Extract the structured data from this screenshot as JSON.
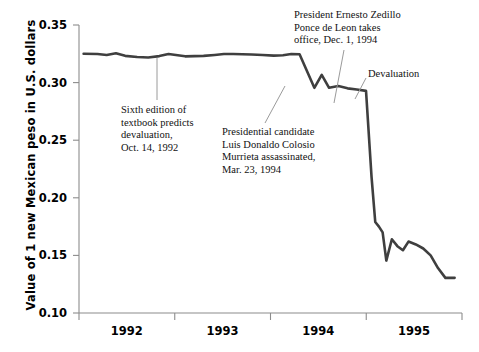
{
  "chart_data": {
    "type": "line",
    "title": "",
    "xlabel": "",
    "ylabel": "Value of 1 new Mexican peso in U.S. dollars",
    "ylim": [
      0.1,
      0.35
    ],
    "ytick_labels": [
      "0.35",
      "0.30",
      "0.25",
      "0.20",
      "0.15",
      "0.10"
    ],
    "ytick_values": [
      0.35,
      0.3,
      0.25,
      0.2,
      0.15,
      0.1
    ],
    "xtick_labels": [
      "1992",
      "1993",
      "1994",
      "1995"
    ],
    "xlim": [
      "1991.75",
      "1995.9"
    ],
    "grid": false,
    "legend": "none",
    "series": [
      {
        "name": "New Mexican peso in U.S. dollars",
        "color": "#3f3f3f",
        "x": [
          1991.8,
          1991.95,
          1992.05,
          1992.15,
          1992.25,
          1992.38,
          1992.5,
          1992.62,
          1992.72,
          1992.8,
          1992.9,
          1993.0,
          1993.1,
          1993.22,
          1993.32,
          1993.42,
          1993.52,
          1993.62,
          1993.74,
          1993.86,
          1993.96,
          1994.05,
          1994.14,
          1994.22,
          1994.3,
          1994.38,
          1994.46,
          1994.56,
          1994.66,
          1994.76,
          1994.86,
          1994.92,
          1994.96,
          1995.0,
          1995.04,
          1995.08,
          1995.14,
          1995.2,
          1995.26,
          1995.32,
          1995.4,
          1995.48,
          1995.56,
          1995.64,
          1995.72,
          1995.82
        ],
        "y": [
          0.325,
          0.3248,
          0.324,
          0.3255,
          0.3232,
          0.3222,
          0.3218,
          0.323,
          0.3248,
          0.324,
          0.3228,
          0.323,
          0.3232,
          0.324,
          0.3248,
          0.3248,
          0.3246,
          0.3244,
          0.324,
          0.3234,
          0.3238,
          0.3248,
          0.3246,
          0.31,
          0.2955,
          0.3068,
          0.2955,
          0.297,
          0.295,
          0.294,
          0.2928,
          0.218,
          0.179,
          0.175,
          0.17,
          0.1455,
          0.164,
          0.158,
          0.1545,
          0.162,
          0.1595,
          0.156,
          0.15,
          0.139,
          0.1305,
          0.1305
        ]
      }
    ],
    "annotations": [
      {
        "id": "textbook-prediction",
        "lines": [
          "Sixth edition of",
          "textbook predicts",
          "devaluation,",
          "Oct. 14, 1992"
        ],
        "text_x": 121,
        "text_y": 104,
        "leader": {
          "x1": 157,
          "y1": 58,
          "x2": 157,
          "y2": 100
        }
      },
      {
        "id": "colosio-assassination",
        "lines": [
          "Presidential candidate",
          "Luis Donaldo Colosio",
          "Murrieta assassinated,",
          "Mar. 23, 1994"
        ],
        "text_x": 222,
        "text_y": 126,
        "leader": {
          "x1": 285,
          "y1": 86,
          "x2": 265,
          "y2": 123
        }
      },
      {
        "id": "zedillo-inauguration",
        "lines": [
          "President Ernesto Zedillo",
          "Ponce de Leon takes",
          "office, Dec. 1, 1994"
        ],
        "text_x": 294,
        "text_y": 9,
        "leader": {
          "x1": 344,
          "y1": 50,
          "x2": 334,
          "y2": 103
        }
      },
      {
        "id": "devaluation",
        "lines": [
          "Devaluation"
        ],
        "text_x": 368,
        "text_y": 68,
        "leader": {
          "x1": 366,
          "y1": 78,
          "x2": 355,
          "y2": 99
        }
      }
    ],
    "axis": {
      "color": "#8c8c8c",
      "left_px": 79,
      "right_px": 462,
      "top_px": 25,
      "bottom_px": 313
    }
  }
}
